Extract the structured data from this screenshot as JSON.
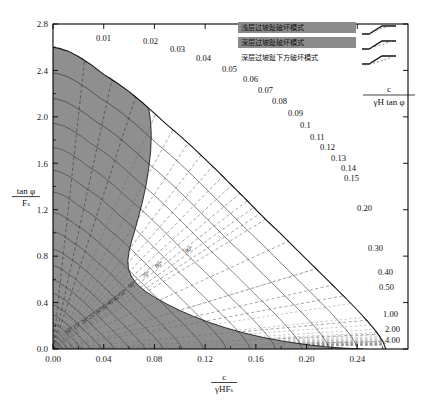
{
  "chart_data": {
    "type": "line",
    "title": "",
    "xlabel": "c / (γHFₛ)",
    "ylabel": "tan φ / Fₛ",
    "xlim": [
      0.0,
      0.28
    ],
    "ylim": [
      0.0,
      2.8
    ],
    "grid": false,
    "xticks": [
      "0.00",
      "0.04",
      "0.08",
      "0.12",
      "0.16",
      "0.20",
      "0.24"
    ],
    "xtick_values": [
      0.0,
      0.04,
      0.08,
      0.12,
      0.16,
      0.2,
      0.24
    ],
    "yticks": [
      "0.0",
      "0.4",
      "0.8",
      "1.2",
      "1.6",
      "2.0",
      "2.4",
      "2.8"
    ],
    "ytick_values": [
      0.0,
      0.4,
      0.8,
      1.2,
      1.6,
      2.0,
      2.4,
      2.8
    ],
    "radial_parameter_label": "c / (γH tan φ)",
    "radial_contours": [
      {
        "label": "0.01",
        "value": 0.01
      },
      {
        "label": "0.02",
        "value": 0.02
      },
      {
        "label": "0.03",
        "value": 0.03
      },
      {
        "label": "0.04",
        "value": 0.04
      },
      {
        "label": "0.05",
        "value": 0.05
      },
      {
        "label": "0.06",
        "value": 0.06
      },
      {
        "label": "0.07",
        "value": 0.07
      },
      {
        "label": "0.08",
        "value": 0.08
      },
      {
        "label": "0.09",
        "value": 0.09
      },
      {
        "label": "0.1",
        "value": 0.1
      },
      {
        "label": "0.11",
        "value": 0.11
      },
      {
        "label": "0.12",
        "value": 0.12
      },
      {
        "label": "0.13",
        "value": 0.13
      },
      {
        "label": "0.14",
        "value": 0.14
      },
      {
        "label": "0.15",
        "value": 0.15
      },
      {
        "label": "0.20",
        "value": 0.2
      },
      {
        "label": "0.30",
        "value": 0.3
      },
      {
        "label": "0.40",
        "value": 0.4
      },
      {
        "label": "0.50",
        "value": 0.5
      },
      {
        "label": "1.00",
        "value": 1.0
      },
      {
        "label": "2.00",
        "value": 2.0
      },
      {
        "label": "4.00",
        "value": 4.0
      }
    ],
    "slope_angle_contours": [
      {
        "label": "90",
        "value": 90
      },
      {
        "label": "80",
        "value": 80
      },
      {
        "label": "70",
        "value": 70
      },
      {
        "label": "60",
        "value": 60
      },
      {
        "label": "50",
        "value": 50
      },
      {
        "label": "45",
        "value": 45
      },
      {
        "label": "40",
        "value": 40
      },
      {
        "label": "35",
        "value": 35
      },
      {
        "label": "30",
        "value": 30
      },
      {
        "label": "25",
        "value": 25
      },
      {
        "label": "20",
        "value": 20
      },
      {
        "label": "15",
        "value": 15
      },
      {
        "label": "10",
        "value": 10
      }
    ],
    "regions": [
      {
        "name": "shaded-shallow-zone",
        "color": "#8c8c8c"
      },
      {
        "name": "white-deep-zone",
        "color": "#ffffff"
      }
    ],
    "envelope_label": "stability-envelope"
  },
  "legend": {
    "parameter_label_numerator": "c",
    "parameter_label_denominator": "γH tan φ",
    "items": [
      {
        "label": "浅层过坡趾破坏模式",
        "swatch": "#8c8c8c",
        "highlight": true
      },
      {
        "label": "深层过坡趾破坏模式",
        "swatch": "#8c8c8c",
        "highlight": true
      },
      {
        "label": "深层过坡趾下方破坏模式",
        "swatch": "#ffffff",
        "highlight": false
      }
    ]
  },
  "axis": {
    "x_numerator": "c",
    "x_denominator": "γHFₛ",
    "y_numerator": "tan φ",
    "y_denominator": "Fₛ"
  }
}
